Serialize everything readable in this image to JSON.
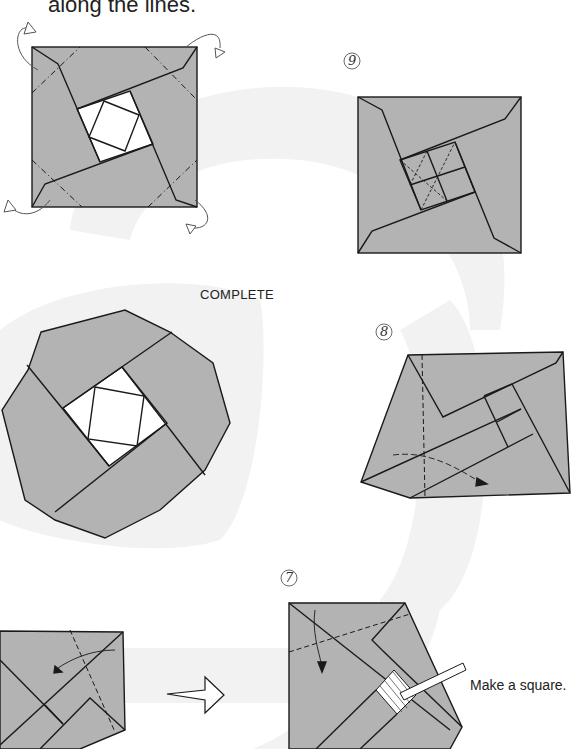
{
  "page": {
    "instruction_partial": "along the lines.",
    "complete_label": "COMPLETE",
    "callout_text": "Make a square.",
    "steps": [
      {
        "number": "9",
        "label": "step-9"
      },
      {
        "number": "8",
        "label": "step-8"
      },
      {
        "number": "7",
        "label": "step-7"
      }
    ]
  },
  "colors": {
    "paper_gray": "#b3b3b3",
    "background_swirl": "#f1f1f1",
    "line": "#1a1a1a",
    "white": "#ffffff"
  }
}
